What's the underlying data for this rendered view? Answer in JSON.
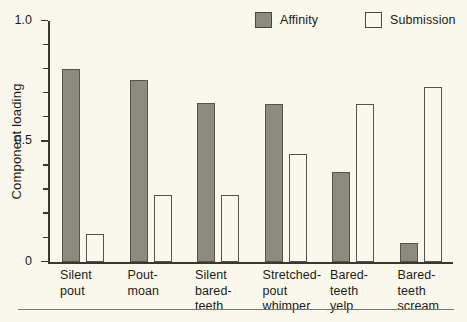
{
  "chart_data": {
    "type": "bar",
    "title": "",
    "xlabel": "",
    "ylabel": "Component loading",
    "ylim": [
      0,
      1.0
    ],
    "grid": false,
    "legend_position": "top-right",
    "y_ticks_major": [
      "0",
      "0.5",
      "1.0"
    ],
    "y_tick_values_major": [
      0,
      0.5,
      1.0
    ],
    "y_tick_values_minor": [
      0.1,
      0.2,
      0.3,
      0.4,
      0.6,
      0.7,
      0.8,
      0.9
    ],
    "categories": [
      "Silent\npout",
      "Pout-\nmoan",
      "Silent\nbared-\nteeth",
      "Stretched-\npout\nwhimper",
      "Bared-\nteeth\nyelp",
      "Bared-\nteeth\nscream"
    ],
    "series": [
      {
        "name": "Affinity",
        "style": "filled",
        "color": "#8d8a7e",
        "values": [
          0.8,
          0.755,
          0.66,
          0.655,
          0.375,
          0.08
        ]
      },
      {
        "name": "Submission",
        "style": "hollow",
        "color": "#faf8ec",
        "values": [
          0.115,
          0.28,
          0.28,
          0.45,
          0.655,
          0.725
        ]
      }
    ]
  },
  "legend": {
    "items": [
      {
        "label": "Affinity"
      },
      {
        "label": "Submission"
      }
    ]
  },
  "colors": {
    "background": "#faf8ec",
    "axis": "#3a372f",
    "bar_outline": "#57534a",
    "affinity_fill": "#8d8a7e",
    "submission_fill": "#faf8ec",
    "rule": "#7a766a"
  }
}
